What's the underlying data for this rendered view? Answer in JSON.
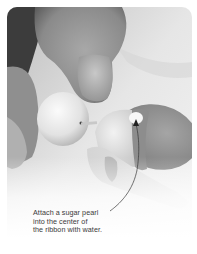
{
  "photo": {
    "subject": "hands attaching a sugar pearl to a fondant figure",
    "style": "grayscale photograph with rounded top corners fading to white"
  },
  "annotation": {
    "lines": [
      "Attach a sugar pearl",
      "into the center of",
      "the ribbon with water."
    ],
    "arrow": "curved-arrow pointing up to the ribbon center"
  },
  "colors": {
    "text": "#3a3a3a",
    "arrow": "#333333",
    "background": "#ffffff"
  }
}
